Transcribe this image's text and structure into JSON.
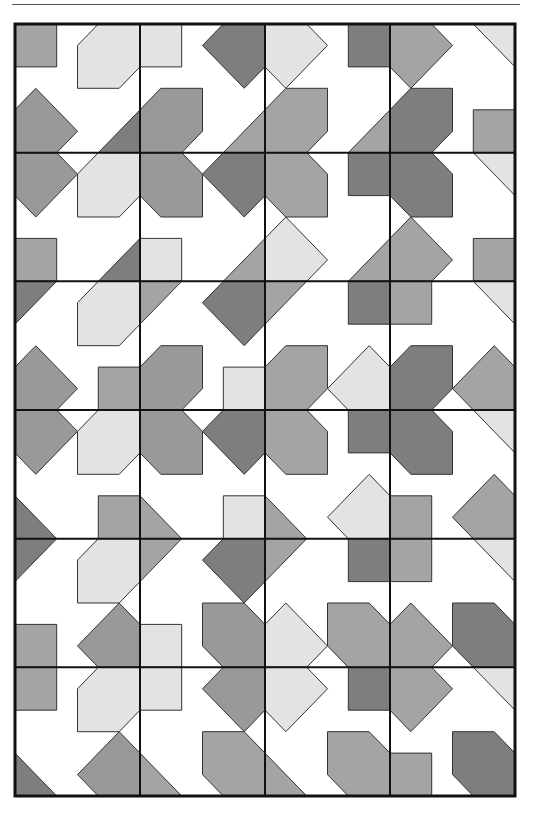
{
  "header": {
    "cut_off_text": "·  · ·"
  },
  "pattern": {
    "frame": {
      "x": 15,
      "y": 24,
      "width": 500,
      "height": 772,
      "stroke": "#111111"
    },
    "cols": 4,
    "rows": 6,
    "palette": {
      "L": "#e3e3e3",
      "M": "#a4a4a4",
      "D": "#7e7e7e",
      "S": "#999999"
    },
    "shapes": {
      "sqTL": [
        [
          0,
          0
        ],
        [
          2,
          0
        ],
        [
          2,
          2
        ],
        [
          0,
          2
        ]
      ],
      "sqTR": [
        [
          4,
          0
        ],
        [
          6,
          0
        ],
        [
          6,
          2
        ],
        [
          4,
          2
        ]
      ],
      "sqBL": [
        [
          0,
          4
        ],
        [
          2,
          4
        ],
        [
          2,
          6
        ],
        [
          0,
          6
        ]
      ],
      "sqBR": [
        [
          4,
          4
        ],
        [
          6,
          4
        ],
        [
          6,
          6
        ],
        [
          4,
          6
        ]
      ],
      "octTR": [
        [
          4,
          0
        ],
        [
          6,
          0
        ],
        [
          6,
          2
        ],
        [
          5,
          3
        ],
        [
          3,
          3
        ],
        [
          3,
          1
        ]
      ],
      "dmTR": [
        [
          4,
          0
        ],
        [
          6,
          0
        ],
        [
          6,
          2
        ],
        [
          5,
          3
        ],
        [
          3,
          1
        ]
      ],
      "octTL": [
        [
          0,
          0
        ],
        [
          2,
          0
        ],
        [
          3,
          1
        ],
        [
          3,
          3
        ],
        [
          1,
          3
        ],
        [
          0,
          2
        ]
      ],
      "dmTL": [
        [
          0,
          0
        ],
        [
          2,
          0
        ],
        [
          3,
          1
        ],
        [
          1,
          3
        ],
        [
          0,
          2
        ]
      ],
      "octBL": [
        [
          0,
          4
        ],
        [
          1,
          3
        ],
        [
          3,
          3
        ],
        [
          3,
          5
        ],
        [
          2,
          6
        ],
        [
          0,
          6
        ]
      ],
      "dmBL": [
        [
          0,
          4
        ],
        [
          1,
          3
        ],
        [
          3,
          5
        ],
        [
          2,
          6
        ],
        [
          0,
          6
        ]
      ],
      "octBR": [
        [
          3,
          3
        ],
        [
          5,
          3
        ],
        [
          6,
          4
        ],
        [
          6,
          6
        ],
        [
          4,
          6
        ],
        [
          3,
          5
        ]
      ],
      "dmBR": [
        [
          3,
          5
        ],
        [
          5,
          3
        ],
        [
          6,
          4
        ],
        [
          6,
          6
        ],
        [
          4,
          6
        ]
      ],
      "triBR": [
        [
          4,
          6
        ],
        [
          6,
          4
        ],
        [
          6,
          6
        ]
      ],
      "triTR": [
        [
          4,
          0
        ],
        [
          6,
          0
        ],
        [
          6,
          2
        ]
      ],
      "triBL": [
        [
          0,
          4
        ],
        [
          2,
          6
        ],
        [
          0,
          6
        ]
      ],
      "triTL": [
        [
          0,
          0
        ],
        [
          2,
          0
        ],
        [
          0,
          2
        ]
      ]
    },
    "cells": [
      {
        "col": 0,
        "row": 0,
        "parts": [
          [
            "sqTL",
            "M"
          ],
          [
            "octTR",
            "L"
          ],
          [
            "dmBL",
            "S"
          ],
          [
            "triBR",
            "D"
          ]
        ]
      },
      {
        "col": 1,
        "row": 0,
        "parts": [
          [
            "sqTL",
            "L"
          ],
          [
            "dmTR",
            "D"
          ],
          [
            "octBL",
            "S"
          ],
          [
            "triBR",
            "M"
          ]
        ]
      },
      {
        "col": 2,
        "row": 0,
        "parts": [
          [
            "dmTL",
            "L"
          ],
          [
            "sqTR",
            "D"
          ],
          [
            "octBL",
            "M"
          ],
          [
            "triBR",
            "M"
          ]
        ]
      },
      {
        "col": 3,
        "row": 0,
        "parts": [
          [
            "dmTL",
            "M"
          ],
          [
            "triTR",
            "L"
          ],
          [
            "octBL",
            "D"
          ],
          [
            "sqBR",
            "M"
          ]
        ]
      },
      {
        "col": 0,
        "row": 1,
        "parts": [
          [
            "dmTL",
            "S"
          ],
          [
            "octTR",
            "L"
          ],
          [
            "sqBL",
            "M"
          ],
          [
            "triBR",
            "D"
          ]
        ]
      },
      {
        "col": 1,
        "row": 1,
        "parts": [
          [
            "octTL",
            "S"
          ],
          [
            "dmTR",
            "D"
          ],
          [
            "sqBL",
            "L"
          ],
          [
            "triBR",
            "M"
          ]
        ]
      },
      {
        "col": 2,
        "row": 1,
        "parts": [
          [
            "octTL",
            "M"
          ],
          [
            "sqTR",
            "D"
          ],
          [
            "dmBL",
            "L"
          ],
          [
            "triBR",
            "M"
          ]
        ]
      },
      {
        "col": 3,
        "row": 1,
        "parts": [
          [
            "octTL",
            "D"
          ],
          [
            "triTR",
            "L"
          ],
          [
            "dmBL",
            "M"
          ],
          [
            "sqBR",
            "M"
          ]
        ]
      },
      {
        "col": 0,
        "row": 2,
        "parts": [
          [
            "triTL",
            "D"
          ],
          [
            "octTR",
            "L"
          ],
          [
            "dmBL",
            "S"
          ],
          [
            "sqBR",
            "M"
          ]
        ]
      },
      {
        "col": 1,
        "row": 2,
        "parts": [
          [
            "triTL",
            "M"
          ],
          [
            "dmTR",
            "D"
          ],
          [
            "octBL",
            "S"
          ],
          [
            "sqBR",
            "L"
          ]
        ]
      },
      {
        "col": 2,
        "row": 2,
        "parts": [
          [
            "triTL",
            "M"
          ],
          [
            "sqTR",
            "D"
          ],
          [
            "octBL",
            "M"
          ],
          [
            "dmBR",
            "L"
          ]
        ]
      },
      {
        "col": 3,
        "row": 2,
        "parts": [
          [
            "sqTL",
            "M"
          ],
          [
            "triTR",
            "L"
          ],
          [
            "octBL",
            "D"
          ],
          [
            "dmBR",
            "M"
          ]
        ]
      },
      {
        "col": 0,
        "row": 3,
        "parts": [
          [
            "dmTL",
            "S"
          ],
          [
            "octTR",
            "L"
          ],
          [
            "triBL",
            "D"
          ],
          [
            "sqBR",
            "M"
          ]
        ]
      },
      {
        "col": 1,
        "row": 3,
        "parts": [
          [
            "octTL",
            "S"
          ],
          [
            "dmTR",
            "D"
          ],
          [
            "triBL",
            "M"
          ],
          [
            "sqBR",
            "L"
          ]
        ]
      },
      {
        "col": 2,
        "row": 3,
        "parts": [
          [
            "octTL",
            "M"
          ],
          [
            "sqTR",
            "D"
          ],
          [
            "triBL",
            "M"
          ],
          [
            "dmBR",
            "L"
          ]
        ]
      },
      {
        "col": 3,
        "row": 3,
        "parts": [
          [
            "octTL",
            "D"
          ],
          [
            "triTR",
            "L"
          ],
          [
            "sqBL",
            "M"
          ],
          [
            "dmBR",
            "M"
          ]
        ]
      },
      {
        "col": 0,
        "row": 4,
        "parts": [
          [
            "triTL",
            "D"
          ],
          [
            "octTR",
            "L"
          ],
          [
            "sqBL",
            "M"
          ],
          [
            "dmBR",
            "S"
          ]
        ]
      },
      {
        "col": 1,
        "row": 4,
        "parts": [
          [
            "triTL",
            "M"
          ],
          [
            "dmTR",
            "D"
          ],
          [
            "sqBL",
            "L"
          ],
          [
            "octBR",
            "S"
          ]
        ]
      },
      {
        "col": 2,
        "row": 4,
        "parts": [
          [
            "triTL",
            "M"
          ],
          [
            "sqTR",
            "D"
          ],
          [
            "dmBL",
            "L"
          ],
          [
            "octBR",
            "M"
          ]
        ]
      },
      {
        "col": 3,
        "row": 4,
        "parts": [
          [
            "sqTL",
            "M"
          ],
          [
            "triTR",
            "L"
          ],
          [
            "dmBL",
            "M"
          ],
          [
            "octBR",
            "D"
          ]
        ]
      },
      {
        "col": 0,
        "row": 5,
        "parts": [
          [
            "sqTL",
            "M"
          ],
          [
            "octTR",
            "L"
          ],
          [
            "triBL",
            "D"
          ],
          [
            "dmBR",
            "S"
          ]
        ]
      },
      {
        "col": 1,
        "row": 5,
        "parts": [
          [
            "sqTL",
            "L"
          ],
          [
            "dmTR",
            "S"
          ],
          [
            "triBL",
            "M"
          ],
          [
            "octBR",
            "M"
          ]
        ]
      },
      {
        "col": 2,
        "row": 5,
        "parts": [
          [
            "dmTL",
            "L"
          ],
          [
            "sqTR",
            "D"
          ],
          [
            "triBL",
            "M"
          ],
          [
            "octBR",
            "M"
          ]
        ]
      },
      {
        "col": 3,
        "row": 5,
        "parts": [
          [
            "dmTL",
            "M"
          ],
          [
            "triTR",
            "L"
          ],
          [
            "sqBL",
            "M"
          ],
          [
            "octBR",
            "D"
          ]
        ]
      }
    ]
  }
}
